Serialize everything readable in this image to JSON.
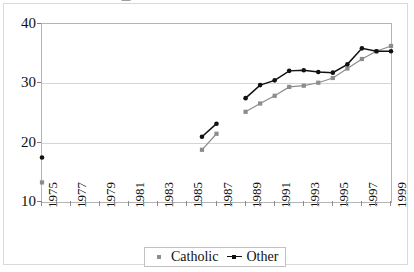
{
  "title_clipped": "—",
  "chart_data": {
    "type": "line",
    "title": "",
    "subtitle": "",
    "xlabel": "",
    "ylabel": "",
    "xlim": [
      1975,
      1999
    ],
    "ylim": [
      10,
      40
    ],
    "yticks": [
      10,
      20,
      30,
      40
    ],
    "ytick_labels": [
      "10",
      "20",
      "30",
      "40"
    ],
    "xticks": [
      1975,
      1976,
      1977,
      1978,
      1979,
      1980,
      1981,
      1982,
      1983,
      1984,
      1985,
      1986,
      1987,
      1988,
      1989,
      1990,
      1991,
      1992,
      1993,
      1994,
      1995,
      1996,
      1997,
      1998,
      1999
    ],
    "xtick_labels": [
      "1975",
      "",
      "1977",
      "",
      "1979",
      "",
      "1981",
      "",
      "1983",
      "",
      "1985",
      "",
      "1987",
      "",
      "1989",
      "",
      "1991",
      "",
      "1993",
      "",
      "1995",
      "",
      "1997",
      "",
      "1999"
    ],
    "grid": "horizontal",
    "legend_position": "bottom-center",
    "series": [
      {
        "name": "Catholic",
        "color": "#8c8c8c",
        "marker": "square",
        "points": [
          {
            "x": 1975,
            "y": 13.3
          },
          {
            "x": 1986,
            "y": 18.8
          },
          {
            "x": 1987,
            "y": 21.5
          },
          {
            "x": 1989,
            "y": 25.2
          },
          {
            "x": 1990,
            "y": 26.6
          },
          {
            "x": 1991,
            "y": 27.9
          },
          {
            "x": 1992,
            "y": 29.4
          },
          {
            "x": 1993,
            "y": 29.6
          },
          {
            "x": 1994,
            "y": 30.1
          },
          {
            "x": 1995,
            "y": 30.9
          },
          {
            "x": 1996,
            "y": 32.5
          },
          {
            "x": 1997,
            "y": 34.1
          },
          {
            "x": 1998,
            "y": 35.4
          },
          {
            "x": 1999,
            "y": 36.3
          }
        ],
        "segments": [
          [
            1975
          ],
          [
            1986,
            1987
          ],
          [
            1989,
            1990,
            1991,
            1992,
            1993,
            1994,
            1995,
            1996,
            1997,
            1998,
            1999
          ]
        ]
      },
      {
        "name": "Other",
        "color": "#111111",
        "marker": "circle",
        "points": [
          {
            "x": 1975,
            "y": 17.5
          },
          {
            "x": 1986,
            "y": 21.0
          },
          {
            "x": 1987,
            "y": 23.2
          },
          {
            "x": 1989,
            "y": 27.5
          },
          {
            "x": 1990,
            "y": 29.7
          },
          {
            "x": 1991,
            "y": 30.5
          },
          {
            "x": 1992,
            "y": 32.1
          },
          {
            "x": 1993,
            "y": 32.2
          },
          {
            "x": 1994,
            "y": 31.9
          },
          {
            "x": 1995,
            "y": 31.8
          },
          {
            "x": 1996,
            "y": 33.2
          },
          {
            "x": 1997,
            "y": 35.9
          },
          {
            "x": 1998,
            "y": 35.4
          },
          {
            "x": 1999,
            "y": 35.4
          }
        ],
        "segments": [
          [
            1975
          ],
          [
            1986,
            1987
          ],
          [
            1989,
            1990,
            1991,
            1992,
            1993,
            1994,
            1995,
            1996,
            1997,
            1998,
            1999
          ]
        ]
      }
    ],
    "legend": [
      {
        "label": "Catholic",
        "color": "#8c8c8c",
        "marker": "square"
      },
      {
        "label": "Other",
        "color": "#111111",
        "marker": "line-dot"
      }
    ]
  }
}
